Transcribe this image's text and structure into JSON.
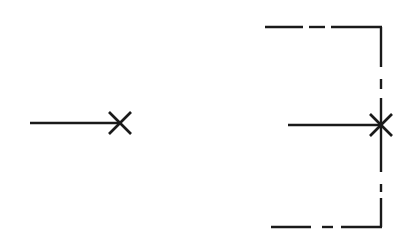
{
  "diagram": {
    "stroke_color": "#1a1a1a",
    "background": "#ffffff",
    "figures": [
      {
        "id": "left",
        "description": "Horizontal line terminating in an X mark",
        "line": {
          "x1": 30,
          "y1": 123,
          "x2": 119,
          "y2": 123
        },
        "x_mark": {
          "cx": 120,
          "cy": 123,
          "size": 11
        }
      },
      {
        "id": "right",
        "description": "Horizontal line ending in an X/asterisk on a dash-dot bracket boundary",
        "line": {
          "x1": 288,
          "y1": 125,
          "x2": 381,
          "y2": 125
        },
        "x_mark": {
          "cx": 381,
          "cy": 125,
          "size": 11
        },
        "bracket": {
          "top_y": 27,
          "bottom_y": 227,
          "right_x": 381,
          "top_segments": [
            [
              265,
              303
            ],
            [
              309,
              325
            ],
            [
              331,
              382
            ]
          ],
          "bottom_segments": [
            [
              271,
              311
            ],
            [
              322,
              333
            ],
            [
              341,
              382
            ]
          ],
          "vertical_segments": [
            [
              27,
              67
            ],
            [
              79,
              89
            ],
            [
              98,
              172
            ],
            [
              184,
              192
            ],
            [
              198,
              227
            ]
          ]
        }
      }
    ]
  }
}
